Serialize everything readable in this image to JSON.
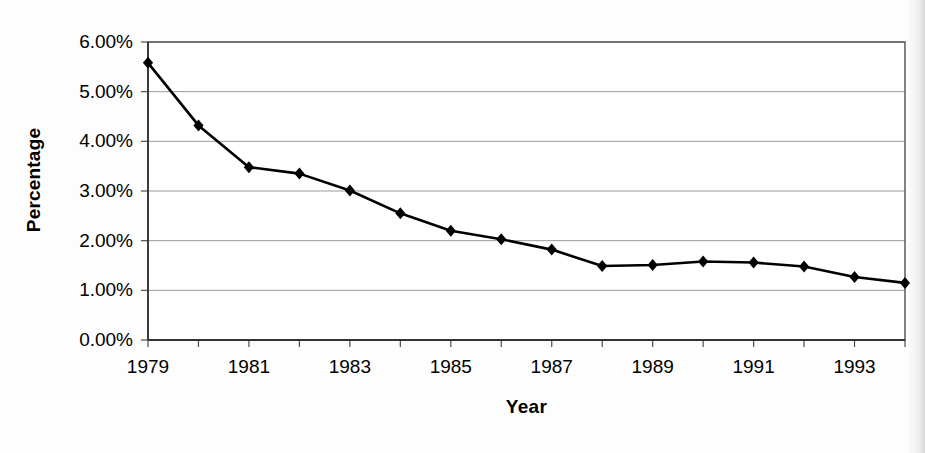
{
  "chart_data": {
    "type": "line",
    "title": "",
    "xlabel": "Year",
    "ylabel": "Percentage",
    "x": [
      1979,
      1980,
      1981,
      1982,
      1983,
      1984,
      1985,
      1986,
      1987,
      1988,
      1989,
      1990,
      1991,
      1992,
      1993,
      1994
    ],
    "values": [
      5.58,
      4.32,
      3.48,
      3.35,
      3.01,
      2.55,
      2.2,
      2.03,
      1.82,
      1.49,
      1.51,
      1.58,
      1.56,
      1.48,
      1.27,
      1.15
    ],
    "series": [
      {
        "name": "Percentage",
        "values": [
          5.58,
          4.32,
          3.48,
          3.35,
          3.01,
          2.55,
          2.2,
          2.03,
          1.82,
          1.49,
          1.51,
          1.58,
          1.56,
          1.48,
          1.27,
          1.15
        ]
      }
    ],
    "ylim": [
      0,
      6
    ],
    "xlim": [
      1979,
      1994
    ],
    "y_ticks": [
      0,
      1,
      2,
      3,
      4,
      5,
      6
    ],
    "y_tick_labels": [
      "0.00%",
      "1.00%",
      "2.00%",
      "3.00%",
      "4.00%",
      "5.00%",
      "6.00%"
    ],
    "x_ticks": [
      1979,
      1980,
      1981,
      1982,
      1983,
      1984,
      1985,
      1986,
      1987,
      1988,
      1989,
      1990,
      1991,
      1992,
      1993,
      1994
    ],
    "x_tick_labels": [
      "1979",
      "",
      "1981",
      "",
      "1983",
      "",
      "1985",
      "",
      "1987",
      "",
      "1989",
      "",
      "1991",
      "",
      "1993",
      ""
    ],
    "x_labeled_ticks": [
      {
        "value": 1979,
        "label": "1979"
      },
      {
        "value": 1981,
        "label": "1981"
      },
      {
        "value": 1983,
        "label": "1983"
      },
      {
        "value": 1985,
        "label": "1985"
      },
      {
        "value": 1987,
        "label": "1987"
      },
      {
        "value": 1989,
        "label": "1989"
      },
      {
        "value": 1991,
        "label": "1991"
      },
      {
        "value": 1993,
        "label": "1993"
      }
    ],
    "grid": true,
    "grid_axis": "y",
    "legend": false,
    "legend_position": "none",
    "marker": "diamond",
    "line_color": "#000000",
    "marker_color": "#000000",
    "grid_color": "#9a9a9a",
    "axis_color": "#4d4d4d",
    "background_color": "#fdfdfd",
    "line_width": 2.6,
    "marker_size": 9
  }
}
